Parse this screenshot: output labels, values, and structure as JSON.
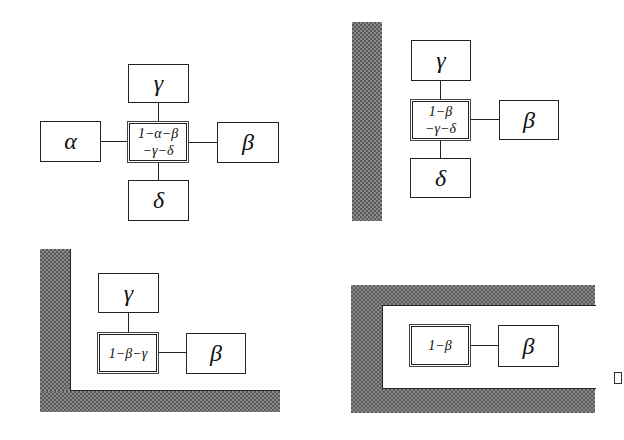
{
  "panels": [
    {
      "id": "open",
      "wall": "none",
      "center_label": [
        "1−α−β",
        "−γ−δ"
      ],
      "neighbors": {
        "up": "γ",
        "left": "α",
        "right": "β",
        "down": "δ"
      }
    },
    {
      "id": "wall-left",
      "wall": "left",
      "center_label": [
        "1−β",
        "−γ−δ"
      ],
      "neighbors": {
        "up": "γ",
        "right": "β",
        "down": "δ"
      }
    },
    {
      "id": "corner",
      "wall": "left-bottom",
      "center_label": [
        "1−β−γ"
      ],
      "neighbors": {
        "up": "γ",
        "right": "β"
      }
    },
    {
      "id": "corridor",
      "wall": "top-left-bottom",
      "center_label": [
        "1−β"
      ],
      "neighbors": {
        "right": "β"
      }
    }
  ],
  "colors": {
    "line": "#222222",
    "wall_light": "#8a8a8a",
    "wall_dark": "#5a5a5a",
    "background": "#ffffff"
  }
}
